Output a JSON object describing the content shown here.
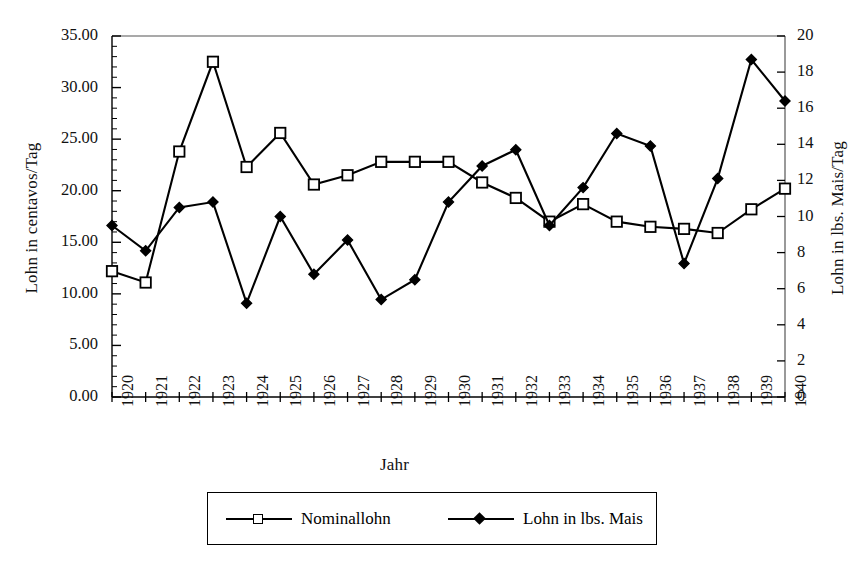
{
  "chart_data": {
    "type": "line",
    "title": "",
    "xlabel": "Jahr",
    "ylabel": "Lohn in centavos/Tag",
    "ylabel_right": "Lohn in lbs. Mais/Tag",
    "grid": false,
    "legend_position": "bottom",
    "x": [
      1920,
      1921,
      1922,
      1923,
      1924,
      1925,
      1926,
      1927,
      1928,
      1929,
      1930,
      1931,
      1932,
      1933,
      1934,
      1935,
      1936,
      1937,
      1938,
      1939,
      1940
    ],
    "categories": [
      "1920",
      "1921",
      "1922",
      "1923",
      "1924",
      "1925",
      "1926",
      "1927",
      "1928",
      "1929",
      "1930",
      "1931",
      "1932",
      "1933",
      "1934",
      "1935",
      "1936",
      "1937",
      "1938",
      "1939",
      "1940"
    ],
    "ylim": [
      0,
      35
    ],
    "yticks": [
      0,
      5,
      10,
      15,
      20,
      25,
      30,
      35
    ],
    "ytick_labels": [
      "0.00",
      "5.00",
      "10.00",
      "15.00",
      "20.00",
      "25.00",
      "30.00",
      "35.00"
    ],
    "ylim_right": [
      0,
      20
    ],
    "yticks_right": [
      0,
      2,
      4,
      6,
      8,
      10,
      12,
      14,
      16,
      18,
      20
    ],
    "ytick_labels_right": [
      "0",
      "2",
      "4",
      "6",
      "8",
      "10",
      "12",
      "14",
      "16",
      "18",
      "20"
    ],
    "series": [
      {
        "name": "Nominallohn",
        "axis": "left",
        "marker": "open-square",
        "values": [
          12.2,
          11.1,
          23.8,
          32.5,
          22.3,
          25.6,
          20.6,
          21.5,
          22.8,
          22.8,
          22.8,
          20.8,
          19.3,
          17.0,
          18.7,
          17.0,
          16.5,
          16.3,
          15.9,
          18.2,
          20.2
        ]
      },
      {
        "name": "Lohn in lbs. Mais",
        "axis": "right",
        "marker": "filled-diamond",
        "values": [
          9.5,
          8.1,
          10.5,
          10.8,
          5.2,
          10.0,
          6.8,
          8.7,
          5.4,
          6.5,
          10.8,
          12.8,
          13.7,
          9.5,
          11.6,
          14.6,
          13.9,
          7.4,
          12.1,
          18.7,
          16.4
        ]
      }
    ]
  },
  "legend": {
    "entries": [
      {
        "label": "Nominallohn"
      },
      {
        "label": "Lohn in lbs. Mais"
      }
    ]
  },
  "colors": {
    "line": "#000000",
    "background": "#ffffff",
    "axis": "#000000"
  }
}
